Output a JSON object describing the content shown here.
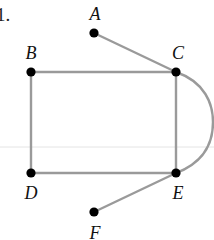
{
  "problem": {
    "number_label": "1."
  },
  "graph": {
    "edge_color": "#9a9a9a",
    "node_color": "#000000",
    "faint_line_color": "#e4e4e4",
    "nodes": [
      {
        "id": "A",
        "label": "A",
        "x": 94,
        "y": 33,
        "label_x": 95,
        "label_y": 14
      },
      {
        "id": "B",
        "label": "B",
        "x": 31,
        "y": 72,
        "label_x": 31,
        "label_y": 53
      },
      {
        "id": "C",
        "label": "C",
        "x": 176,
        "y": 72,
        "label_x": 178,
        "label_y": 53
      },
      {
        "id": "D",
        "label": "D",
        "x": 31,
        "y": 173,
        "label_x": 31,
        "label_y": 193
      },
      {
        "id": "E",
        "label": "E",
        "x": 176,
        "y": 173,
        "label_x": 178,
        "label_y": 193
      },
      {
        "id": "F",
        "label": "F",
        "x": 94,
        "y": 212,
        "label_x": 95,
        "label_y": 233
      }
    ],
    "edges": [
      {
        "from": "A",
        "to": "C",
        "type": "straight"
      },
      {
        "from": "B",
        "to": "C",
        "type": "straight"
      },
      {
        "from": "B",
        "to": "D",
        "type": "straight"
      },
      {
        "from": "D",
        "to": "E",
        "type": "straight"
      },
      {
        "from": "C",
        "to": "E",
        "type": "straight"
      },
      {
        "from": "C",
        "to": "E",
        "type": "curved"
      },
      {
        "from": "F",
        "to": "E",
        "type": "straight"
      }
    ]
  }
}
